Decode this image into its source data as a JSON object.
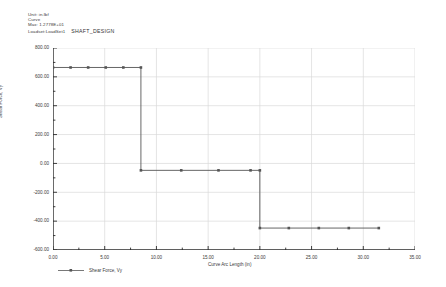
{
  "header": {
    "lines": [
      "Unit: in.lbf",
      "Curve",
      "Max: 1.2778E+01"
    ],
    "loadset_line": "Loadset:LoadSet1",
    "design_title": "SHAFT_DESIGN"
  },
  "legend": {
    "label": "Shear Force, Vy",
    "symbol": "line-marker"
  },
  "colors": {
    "curve": "#555555",
    "grid": "#d8d8d8",
    "axis": "#2a2a2a",
    "text": "#3a3a3a",
    "background": "#ffffff"
  },
  "chart_data": {
    "type": "line",
    "title": "SHAFT_DESIGN",
    "xlabel": "Curve Arc Length (in)",
    "ylabel": "Shear Force, Vy",
    "xlim": [
      0.0,
      35.0
    ],
    "ylim": [
      -600.0,
      800.0
    ],
    "grid": true,
    "legend_position": "bottom-left",
    "xticks": [
      0.0,
      5.0,
      10.0,
      15.0,
      20.0,
      25.0,
      30.0,
      35.0
    ],
    "xticklabels": [
      "0.00",
      "5.00",
      "10.00",
      "15.00",
      "20.00",
      "25.00",
      "30.00",
      "35.00"
    ],
    "yticks": [
      -600.0,
      -400.0,
      -200.0,
      0.0,
      200.0,
      400.0,
      600.0,
      800.0
    ],
    "yticklabels": [
      "-600.00",
      "-400.00",
      "-200.00",
      "0.00",
      "200.00",
      "400.00",
      "600.00",
      "800.00"
    ],
    "series": [
      {
        "name": "Shear Force, Vy",
        "x": [
          0.0,
          1.7,
          3.4,
          5.1,
          6.8,
          8.5,
          8.5,
          12.4,
          16.0,
          19.1,
          20.0,
          20.0,
          22.8,
          25.7,
          28.6,
          31.5
        ],
        "y": [
          665,
          665,
          665,
          665,
          665,
          665,
          -48,
          -48,
          -48,
          -48,
          -48,
          -448,
          -448,
          -448,
          -448,
          -448
        ],
        "markers": [
          true,
          true,
          true,
          true,
          true,
          true,
          true,
          true,
          true,
          true,
          true,
          true,
          true,
          true,
          true,
          true
        ],
        "step_levels": [
          665,
          -48,
          -448
        ],
        "step_breaks": [
          8.5,
          20.0
        ]
      }
    ]
  }
}
